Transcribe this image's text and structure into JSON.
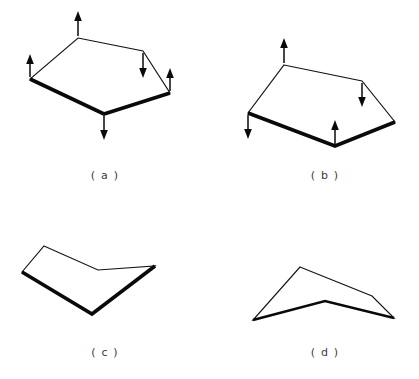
{
  "figure": {
    "background_color": "#ffffff",
    "line_color": "#141414",
    "fold_color": "#0a0a0a",
    "width": 419,
    "height": 379,
    "panels": [
      {
        "id": "a",
        "caption": "( a )",
        "caption_x": 105,
        "caption_y": 179,
        "description": "Pentagon sheet with five force arrows, thick lower-left and lower-right fold edges",
        "outline": "78,38 143,51 170,93 104,114 30,79",
        "fold_edges": [
          "30,79 104,114 170,93"
        ],
        "arrows": [
          {
            "name": "arrow-top-up",
            "x1": 78,
            "y1": 36,
            "x2": 78,
            "y2": 12,
            "direction": "up"
          },
          {
            "name": "arrow-left-up",
            "x1": 30,
            "y1": 77,
            "x2": 30,
            "y2": 55,
            "direction": "up"
          },
          {
            "name": "arrow-upper-right-down",
            "x1": 143,
            "y1": 53,
            "x2": 143,
            "y2": 77,
            "direction": "down"
          },
          {
            "name": "arrow-right-up",
            "x1": 170,
            "y1": 91,
            "x2": 170,
            "y2": 69,
            "direction": "up"
          },
          {
            "name": "arrow-bottom-down",
            "x1": 104,
            "y1": 116,
            "x2": 104,
            "y2": 140,
            "direction": "down"
          }
        ]
      },
      {
        "id": "b",
        "caption": "( b )",
        "caption_x": 325,
        "caption_y": 179,
        "description": "Pentagon sheet with four force arrows, thick lower fold edges",
        "outline": "284,65 362,81 395,122 335,146 248,113",
        "fold_edges": [
          "248,113 335,146 395,122"
        ],
        "arrows": [
          {
            "name": "arrow-top-up",
            "x1": 284,
            "y1": 63,
            "x2": 284,
            "y2": 39,
            "direction": "up"
          },
          {
            "name": "arrow-upper-right-down",
            "x1": 362,
            "y1": 83,
            "x2": 362,
            "y2": 106,
            "direction": "down"
          },
          {
            "name": "arrow-left-down",
            "x1": 248,
            "y1": 115,
            "x2": 248,
            "y2": 139,
            "direction": "down"
          },
          {
            "name": "arrow-bottom-up",
            "x1": 335,
            "y1": 144,
            "x2": 335,
            "y2": 121,
            "direction": "up"
          }
        ]
      },
      {
        "id": "c",
        "caption": "( c )",
        "caption_x": 105,
        "caption_y": 356,
        "description": "Folded sheet, V-shaped crease with thick shadow edge along lower boundary",
        "outline": "44,246 98,270 155,266 92,314 22,272",
        "fold_edges": [
          "22,272 92,314 155,266"
        ],
        "arrows": []
      },
      {
        "id": "d",
        "caption": "( d )",
        "caption_x": 325,
        "caption_y": 356,
        "description": "Folded sheet seen edge-on, thin upper outline and thick lower crease",
        "outline": "300,267 372,296 394,318 325,301 253,320",
        "fold_edges": [
          "253,320 325,301 394,318"
        ],
        "arrows": []
      }
    ]
  }
}
